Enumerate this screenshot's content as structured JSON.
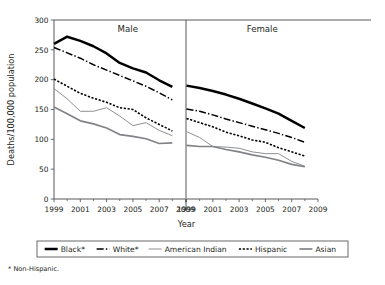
{
  "chart_data": {
    "type": "line",
    "title": "",
    "xlabel": "Year",
    "ylabel": "Deaths/100,000 population",
    "ylim": [
      0,
      300
    ],
    "xlim": [
      1999,
      2009
    ],
    "ytick_labels": [
      "0",
      "50",
      "100",
      "150",
      "200",
      "250",
      "300"
    ],
    "ytick_values": [
      0,
      50,
      100,
      150,
      200,
      250,
      300
    ],
    "xtick_labels": [
      "1999",
      "2001",
      "2003",
      "2005",
      "2007",
      "2009"
    ],
    "xtick_values": [
      1999,
      2001,
      2003,
      2005,
      2007,
      2009
    ],
    "xtick_minor_values": [
      2000,
      2002,
      2004,
      2006,
      2008
    ],
    "grid": false,
    "legend_position": "bottom",
    "footnote": "* Non-Hispanic.",
    "x": [
      1999,
      2000,
      2001,
      2002,
      2003,
      2004,
      2005,
      2006,
      2007,
      2008
    ],
    "panels": [
      {
        "label": "Male",
        "series": [
          {
            "name": "Black*",
            "style": "thick-solid",
            "color": "#000000",
            "values": [
              260,
              272,
              265,
              256,
              244,
              228,
              219,
              212,
              199,
              188
            ]
          },
          {
            "name": "White*",
            "style": "dash-dot",
            "color": "#000000",
            "values": [
              254,
              245,
              236,
              225,
              216,
              207,
              198,
              189,
              178,
              166
            ]
          },
          {
            "name": "American Indian",
            "style": "thin-solid",
            "color": "#808285",
            "values": [
              185,
              168,
              147,
              147,
              153,
              139,
              123,
              128,
              115,
              106
            ]
          },
          {
            "name": "Hispanic",
            "style": "dotted",
            "color": "#000000",
            "values": [
              201,
              189,
              177,
              169,
              162,
              153,
              150,
              136,
              125,
              114
            ]
          },
          {
            "name": "Asian",
            "style": "medium-solid",
            "color": "#808285",
            "values": [
              154,
              143,
              131,
              126,
              119,
              108,
              105,
              101,
              93,
              94
            ]
          }
        ]
      },
      {
        "label": "Female",
        "series": [
          {
            "name": "Black*",
            "style": "thick-solid",
            "color": "#000000",
            "values": [
              190,
              186,
              181,
              175,
              168,
              160,
              152,
              143,
              131,
              119
            ]
          },
          {
            "name": "White*",
            "style": "dash-dot",
            "color": "#000000",
            "values": [
              151,
              147,
              141,
              134,
              128,
              122,
              116,
              110,
              103,
              95
            ]
          },
          {
            "name": "Hispanic",
            "style": "dotted",
            "color": "#000000",
            "values": [
              135,
              128,
              121,
              112,
              106,
              99,
              95,
              86,
              79,
              72
            ]
          },
          {
            "name": "American Indian",
            "style": "thin-solid",
            "color": "#808285",
            "values": [
              113,
              103,
              88,
              87,
              85,
              79,
              76,
              76,
              63,
              55
            ]
          },
          {
            "name": "Asian",
            "style": "medium-solid",
            "color": "#808285",
            "values": [
              90,
              88,
              88,
              83,
              79,
              74,
              70,
              65,
              58,
              54
            ]
          }
        ]
      }
    ],
    "legend": [
      {
        "label": "Black*",
        "style": "thick-solid",
        "color": "#000000"
      },
      {
        "label": "White*",
        "style": "dash-dot",
        "color": "#000000"
      },
      {
        "label": "American Indian",
        "style": "thin-solid",
        "color": "#808285"
      },
      {
        "label": "Hispanic",
        "style": "dotted",
        "color": "#000000"
      },
      {
        "label": "Asian",
        "style": "medium-solid",
        "color": "#808285"
      }
    ]
  }
}
